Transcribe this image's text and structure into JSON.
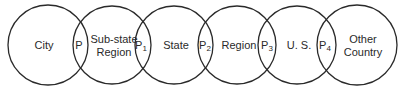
{
  "diagram": {
    "type": "chain of overlapping circles",
    "circles": [
      {
        "id": "city",
        "label_lines": [
          "City"
        ],
        "cx": 48,
        "cy": 45,
        "r": 40
      },
      {
        "id": "substate",
        "label_lines": [
          "Sub-state",
          "Region"
        ],
        "cx": 112,
        "cy": 45,
        "r": 39
      },
      {
        "id": "state",
        "label_lines": [
          "State"
        ],
        "cx": 174,
        "cy": 45,
        "r": 39
      },
      {
        "id": "region",
        "label_lines": [
          "Region"
        ],
        "cx": 237,
        "cy": 45,
        "r": 39
      },
      {
        "id": "us",
        "label_lines": [
          "U. S."
        ],
        "cx": 297,
        "cy": 45,
        "r": 39
      },
      {
        "id": "other",
        "label_lines": [
          "Other",
          "Country"
        ],
        "cx": 357,
        "cy": 45,
        "r": 40
      }
    ],
    "overlaps": [
      {
        "base": "P",
        "sub": "",
        "x": 79
      },
      {
        "base": "P",
        "sub": "1",
        "x": 141
      },
      {
        "base": "P",
        "sub": "2",
        "x": 205
      },
      {
        "base": "P",
        "sub": "3",
        "x": 267
      },
      {
        "base": "P",
        "sub": "4",
        "x": 325
      }
    ],
    "colors": {
      "stroke": "#2a2a2a",
      "text": "#2a2a2a",
      "background": "#ffffff"
    }
  }
}
